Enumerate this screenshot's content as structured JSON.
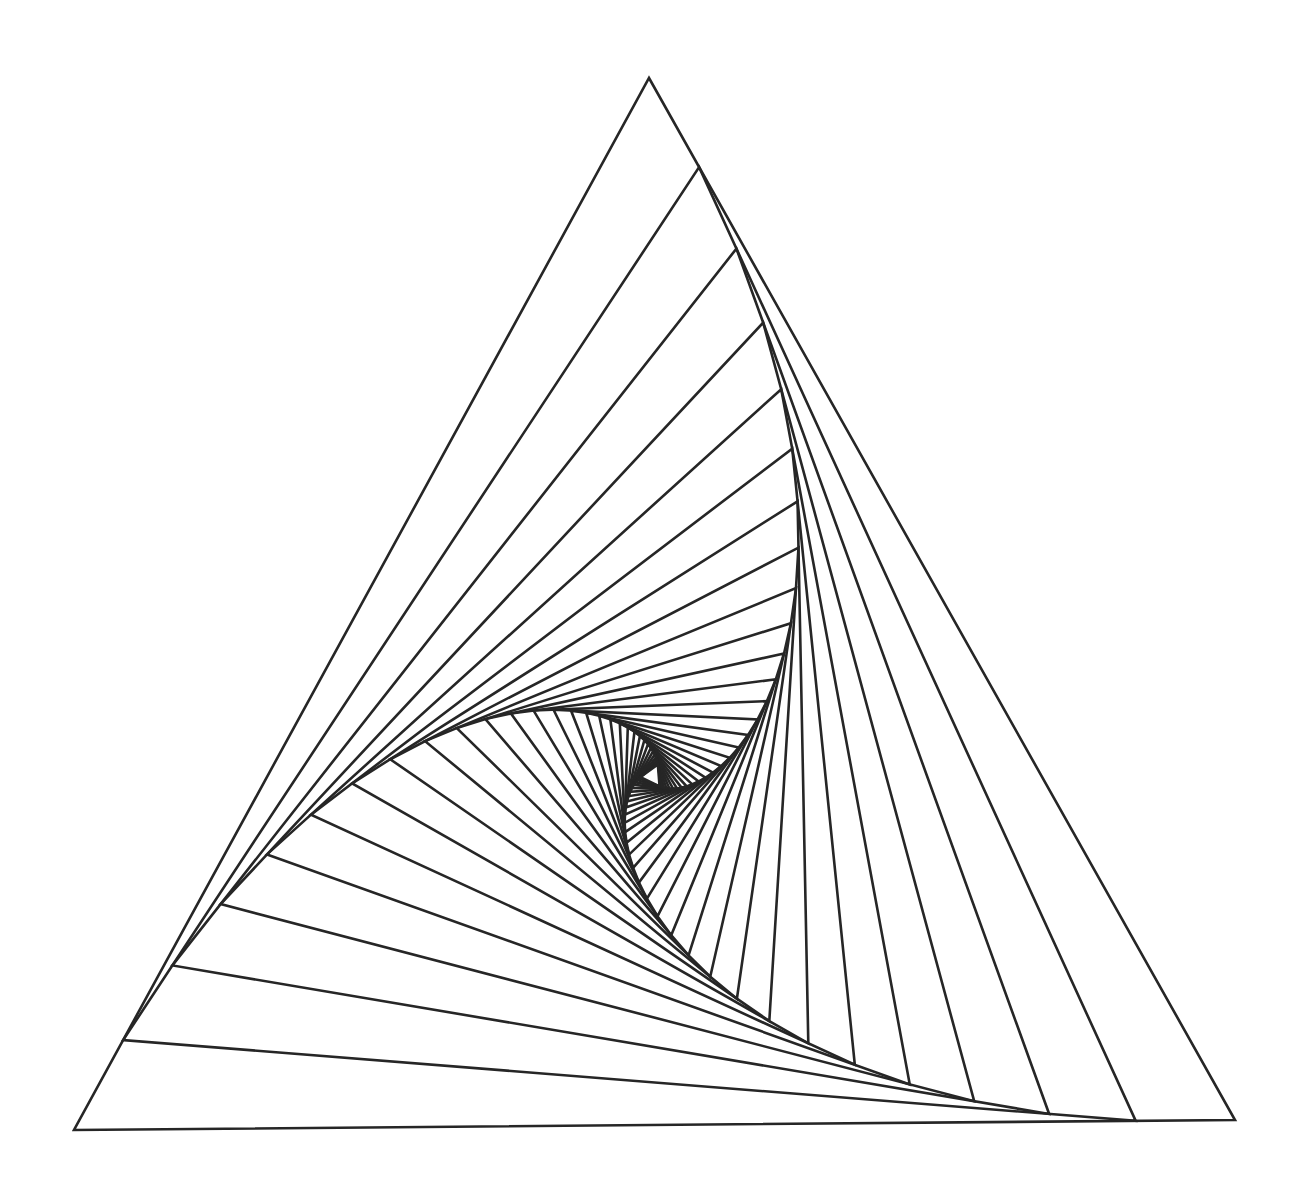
{
  "artwork": {
    "title": "Nested Rotating Triangle Spiral",
    "type": "geometric-line-figure",
    "background_color": "#ffffff",
    "canvas": {
      "width": 1307,
      "height": 1193
    }
  },
  "chart_data": {
    "type": "line",
    "title": "Nested Rotating Triangle Spiral",
    "subtitle": "Iterated triangle inscribed by constant edge-fraction, forming a logarithmic-spiral envelope",
    "xlabel": "",
    "ylabel": "",
    "grid": false,
    "legend": null,
    "axis_visible": false,
    "tick_labels": [],
    "annotations": [],
    "stroke_color": "#262626",
    "stroke_width": 2.6,
    "fill": "none",
    "iterations": 31,
    "edge_fraction": 0.0855,
    "rotation_direction": "clockwise",
    "outer_triangle": {
      "vertices": [
        {
          "name": "apex",
          "x": 649,
          "y": 78
        },
        {
          "name": "bottom-right",
          "x": 1235,
          "y": 1120
        },
        {
          "name": "bottom-left",
          "x": 74,
          "y": 1130
        }
      ],
      "edges": [
        {
          "name": "left-edge",
          "from": "apex",
          "to": "bottom-left"
        },
        {
          "name": "right-edge",
          "from": "apex",
          "to": "bottom-right"
        },
        {
          "name": "bottom-edge",
          "from": "bottom-left",
          "to": "bottom-right"
        }
      ]
    },
    "envelope": {
      "shape": "three-armed logarithmic spiral caustic",
      "convergence_point": {
        "x": 694,
        "y": 790
      },
      "dark_core": true
    },
    "series": [
      {
        "name": "triangle-iterations",
        "count": 31,
        "closed": true,
        "sides": 3
      }
    ]
  }
}
